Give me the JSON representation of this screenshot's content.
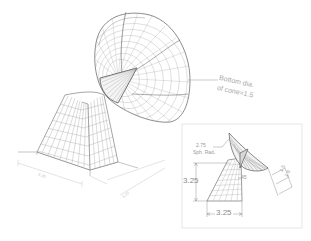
{
  "drawing": {
    "title": "Satellite dish on tapered pedestal - isometric wireframe",
    "colors": {
      "background": "#ffffff",
      "line": "#6e6e6e",
      "line_light": "#b5b5b5",
      "text": "#9a9a9a"
    }
  },
  "main_view": {
    "callout": {
      "line1": "Bottom dia.",
      "line2": "of cone=1.5"
    },
    "base_dims": {
      "width_label": "5.25",
      "depth_label": "3.25"
    }
  },
  "inset_view": {
    "radius_note": {
      "line1": "2.75",
      "line2": "Sph. Rad."
    },
    "height_dim": "3.25",
    "base_dim": "3.25",
    "angle_dim": "45",
    "offset_dims": [
      "1.5",
      "1.6"
    ]
  }
}
